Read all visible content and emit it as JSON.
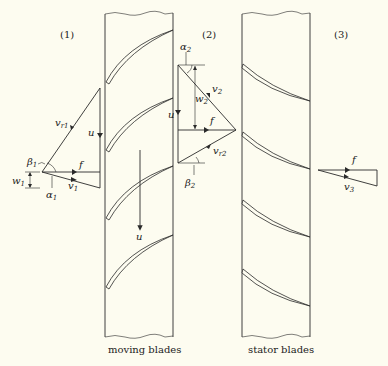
{
  "diagram": {
    "stations": [
      {
        "id": "1",
        "label": "(1)"
      },
      {
        "id": "2",
        "label": "(2)"
      },
      {
        "id": "3",
        "label": "(3)"
      }
    ],
    "captions": {
      "moving": "moving blades",
      "stator": "stator blades"
    },
    "triangle1": {
      "vr": "v",
      "vr_sub": "r1",
      "u": "u",
      "beta": "β",
      "beta_sub": "1",
      "f": "f",
      "w": "w",
      "w_sub": "1",
      "alpha": "α",
      "alpha_sub": "1",
      "v": "v",
      "v_sub": "1"
    },
    "triangle2": {
      "alpha": "α",
      "alpha_sub": "2",
      "v": "v",
      "v_sub": "2",
      "w": "w",
      "w_sub": "2",
      "u": "u",
      "f": "f",
      "vr": "v",
      "vr_sub": "r2",
      "beta": "β",
      "beta_sub": "2"
    },
    "triangle3": {
      "f": "f",
      "v": "v",
      "v_sub": "3"
    },
    "blade_velocity_label": "u",
    "colors": {
      "background": "#fdfcf0",
      "ink": "#2a2a2a"
    }
  }
}
